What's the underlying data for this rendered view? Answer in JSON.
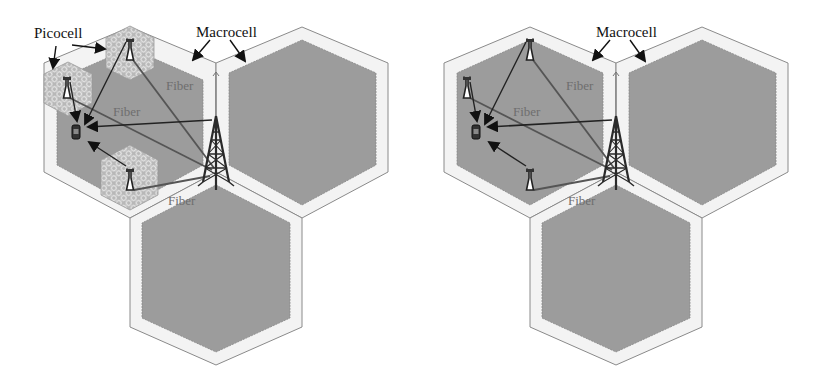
{
  "colors": {
    "background": "#ffffff",
    "macro_outline": "#8a8a8a",
    "macro_band": "#f2f2f2",
    "macro_fill": "#9c9c9c",
    "pico_fill": "#b8b8b8",
    "pico_pattern": "#e4e4e4",
    "link": "#555555",
    "arrow": "#111111",
    "tower": "#2a2a2a",
    "fiber_text": "#6e6e6e"
  },
  "panels": [
    {
      "id": "with-picocells",
      "labels": {
        "picocell": "Picocell",
        "macrocell": "Macrocell",
        "fiber_top": "Fiber",
        "fiber_middle": "Fiber",
        "fiber_bottom": "Fiber"
      },
      "show_picocell_hexes": true
    },
    {
      "id": "without-picocells",
      "labels": {
        "macrocell": "Macrocell",
        "fiber_top": "Fiber",
        "fiber_middle": "Fiber",
        "fiber_bottom": "Fiber"
      },
      "show_picocell_hexes": false
    }
  ],
  "icons": {
    "macro_base_station": "cell-tower-icon",
    "pico_base_station": "antenna-icon",
    "user_equipment": "mobile-phone-icon"
  }
}
